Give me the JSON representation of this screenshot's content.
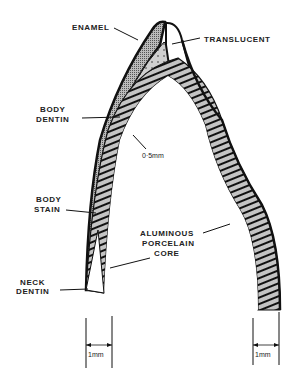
{
  "diagram": {
    "labels": {
      "enamel": "ENAMEL",
      "translucent": "TRANSLUCENT",
      "body_dentin_1": "BODY",
      "body_dentin_2": "DENTIN",
      "thickness_core": "0·5mm",
      "body_stain_1": "BODY",
      "body_stain_2": "STAIN",
      "aluminous_1": "ALUMINOUS",
      "aluminous_2": "PORCELAIN",
      "aluminous_3": "CORE",
      "neck_dentin_1": "NECK",
      "neck_dentin_2": "DENTIN",
      "dim_left": "1mm",
      "dim_right": "1mm"
    },
    "colors": {
      "outline": "#111111",
      "dentin_fill": "#c8c8c8",
      "enamel_fill": "#b0b0b0",
      "core_fill": "#bdbdbd",
      "background": "#ffffff"
    }
  }
}
